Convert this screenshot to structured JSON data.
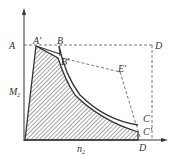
{
  "labels": {
    "A": "A",
    "A_prime": "A'",
    "B": "B",
    "B_prime": "B'",
    "D_top": "D",
    "E_prime": "E'",
    "C": "C",
    "C_prime": "C'",
    "D_bottom": "D",
    "M": "M",
    "M_sub": "2",
    "n": "n",
    "n_sub": "2"
  },
  "colors": {
    "line": "#333333",
    "hatch": "#555555",
    "dashed": "#555555"
  }
}
